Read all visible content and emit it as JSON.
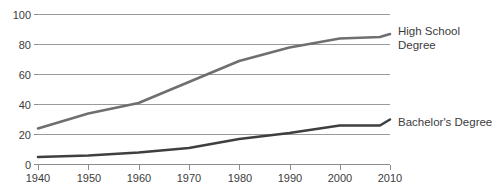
{
  "chart_data": {
    "type": "line",
    "title": "",
    "subtitle": "",
    "xlabel": "",
    "ylabel": "",
    "xlim": [
      1940,
      2010
    ],
    "ylim": [
      0,
      100
    ],
    "grid": "horizontal",
    "legend_position": "right-of-line-end",
    "x_ticks": [
      1940,
      1950,
      1960,
      1970,
      1980,
      1990,
      2000,
      2010
    ],
    "y_ticks": [
      0,
      20,
      40,
      60,
      80,
      100
    ],
    "x": [
      1940,
      1950,
      1960,
      1970,
      1980,
      1990,
      2000,
      2008,
      2010
    ],
    "series": [
      {
        "name": "High School Degree",
        "label_line_1": "High School",
        "label_line_2": "Degree",
        "color": "#6f6f6f",
        "values": [
          24,
          34,
          41,
          55,
          69,
          78,
          84,
          85,
          87
        ]
      },
      {
        "name": "Bachelor's Degree",
        "label_line_1": "Bachelor's Degree",
        "label_line_2": "",
        "color": "#3f3f3f",
        "values": [
          5,
          6,
          8,
          11,
          17,
          21,
          26,
          26,
          30
        ]
      }
    ]
  },
  "axes": {
    "y_tick_labels": [
      "0",
      "20",
      "40",
      "60",
      "80",
      "100"
    ],
    "x_tick_labels": [
      "1940",
      "1950",
      "1960",
      "1970",
      "1980",
      "1990",
      "2000",
      "2010"
    ]
  },
  "labels": {
    "high_school_line_1": "High School",
    "high_school_line_2": "Degree",
    "bachelors": "Bachelor's Degree"
  },
  "colors": {
    "background": "#ffffff",
    "grid": "#9a9a9a",
    "axis": "#8d8d8d",
    "text": "#3c3c3c",
    "high_school_series": "#6f6f6f",
    "bachelors_series": "#3f3f3f"
  }
}
